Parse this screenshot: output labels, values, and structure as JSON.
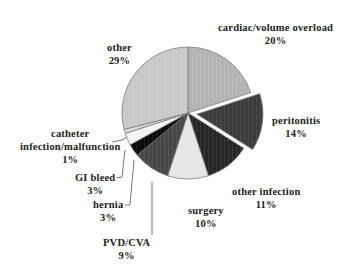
{
  "chart_data": {
    "type": "pie",
    "title": "",
    "start_angle_deg": 0,
    "direction": "clockwise",
    "slices": [
      {
        "label": "cardiac/volume overload",
        "value": 20,
        "pct_label": "20%",
        "color": "#b4b4b4",
        "exploded": false
      },
      {
        "label": "peritonitis",
        "value": 14,
        "pct_label": "14%",
        "color": "#3c3c3c",
        "exploded": true
      },
      {
        "label": "other infection",
        "value": 11,
        "pct_label": "11%",
        "color": "#262626",
        "exploded": false
      },
      {
        "label": "surgery",
        "value": 10,
        "pct_label": "10%",
        "color": "#e6e6e6",
        "exploded": false
      },
      {
        "label": "PVD/CVA",
        "value": 9,
        "pct_label": "9%",
        "color": "#474747",
        "exploded": false
      },
      {
        "label": "hernia",
        "value": 3,
        "pct_label": "3%",
        "color": "#0a0a0a",
        "exploded": false
      },
      {
        "label": "GI bleed",
        "value": 3,
        "pct_label": "3%",
        "color": "#f4f4f4",
        "exploded": false
      },
      {
        "label": "catheter infection/malfunction",
        "value": 1,
        "pct_label": "1%",
        "color": "#d9d9d9",
        "exploded": false
      },
      {
        "label": "other",
        "value": 29,
        "pct_label": "29%",
        "color": "#c9c9c9",
        "exploded": false
      }
    ],
    "legend": "none (data labels on chart)"
  },
  "labels": {
    "cardiac": {
      "name": "cardiac/volume overload",
      "pct": "20%"
    },
    "peritonitis": {
      "name": "peritonitis",
      "pct": "14%"
    },
    "other_infection": {
      "name": "other infection",
      "pct": "11%"
    },
    "surgery": {
      "name": "surgery",
      "pct": "10%"
    },
    "pvd": {
      "name": "PVD/CVA",
      "pct": "9%"
    },
    "hernia": {
      "name": "hernia",
      "pct": "3%"
    },
    "gi_bleed": {
      "name": "GI bleed",
      "pct": "3%"
    },
    "catheter": {
      "name1": "catheter",
      "name2": "infection/malfunction",
      "pct": "1%"
    },
    "other": {
      "name": "other",
      "pct": "29%"
    }
  }
}
